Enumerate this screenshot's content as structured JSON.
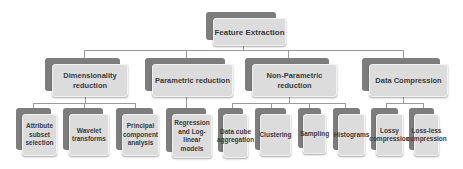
{
  "diagram": {
    "type": "hierarchy-tree",
    "root": {
      "label": "Feature Extraction"
    },
    "categories": [
      {
        "label": "Dimensionality reduction",
        "children": [
          {
            "label": "Attribute subset selection"
          },
          {
            "label": "Wavelet transforms"
          },
          {
            "label": "Principal component analysis"
          }
        ]
      },
      {
        "label": "Parametric reduction",
        "children": [
          {
            "label": "Regression and Log-linear models"
          }
        ]
      },
      {
        "label": "Non-Parametric reduction",
        "children": [
          {
            "label": "Data cube aggregation"
          },
          {
            "label": "Clustering"
          },
          {
            "label": "Sampling"
          },
          {
            "label": "Histograms"
          }
        ]
      },
      {
        "label": "Data Compression",
        "children": [
          {
            "label": "Lossy compression"
          },
          {
            "label": "Loss-less compression"
          }
        ]
      }
    ],
    "colors": {
      "box_fill": "#dcdcdc",
      "box_shadow": "#7d7d7d",
      "text": "#3a3a3a",
      "connector": "#9a9a9a"
    }
  }
}
